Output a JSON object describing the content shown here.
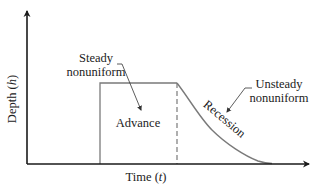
{
  "axes": {
    "x_label": "Time",
    "x_symbol": "t",
    "y_label": "Depth",
    "y_symbol": "h"
  },
  "labels": {
    "steady_line1": "Steady",
    "steady_line2": "nonuniform",
    "unsteady_line1": "Unsteady",
    "unsteady_line2": "nonuniform",
    "advance": "Advance",
    "recession": "Recession"
  },
  "colors": {
    "axis": "#1a1a1a",
    "curve": "#7a7a7a",
    "text": "#222222"
  },
  "geometry": {
    "origin": [
      27,
      164
    ],
    "x_axis_end": [
      312,
      164
    ],
    "y_axis_end": [
      27,
      8
    ],
    "advance_start_x": 100,
    "plateau_y": 83,
    "recession_start_x": 177,
    "recession_end_x": 272
  }
}
